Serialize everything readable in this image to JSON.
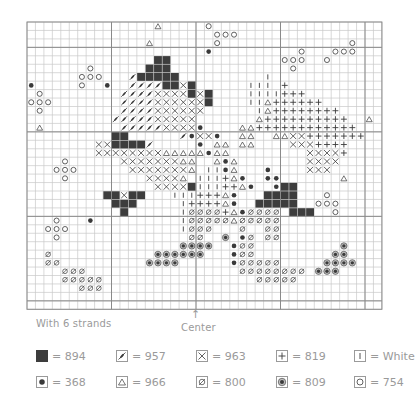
{
  "caption_left": "With 6 strands",
  "caption_center": "Center",
  "center_arrow": "↑",
  "grid": {
    "cols": 42,
    "rows": 34,
    "origin_x": 27,
    "origin_y": 22,
    "cell": 8.45,
    "bold_cols": [
      10,
      20,
      30,
      40
    ],
    "bold_rows": [
      3,
      13,
      23,
      33
    ]
  },
  "colors": {
    "ink": "#3a3a3a",
    "grid_line": "#c8c8c8",
    "bold_line": "#8a8a8a",
    "legend_text": "#9a9a9a"
  },
  "legend": [
    {
      "symbol": "B",
      "icon": "filled-square-icon",
      "label": "= 894"
    },
    {
      "symbol": "S",
      "icon": "slash-leaf-icon",
      "label": "= 957"
    },
    {
      "symbol": "X",
      "icon": "cross-x-icon",
      "label": "= 963"
    },
    {
      "symbol": "P",
      "icon": "plus-icon",
      "label": "= 819"
    },
    {
      "symbol": "I",
      "icon": "vertical-bar-icon",
      "label": "= White"
    },
    {
      "symbol": "D",
      "icon": "filled-dot-icon",
      "label": "= 368"
    },
    {
      "symbol": "T",
      "icon": "triangle-icon",
      "label": "= 966"
    },
    {
      "symbol": "Z",
      "icon": "slashed-circle-icon",
      "label": "= 800"
    },
    {
      "symbol": "R",
      "icon": "ringed-dot-icon",
      "label": "= 809"
    },
    {
      "symbol": "O",
      "icon": "open-circle-icon",
      "label": "= 754"
    }
  ],
  "cells": [
    "...............T.....O....................",
    "......................OOO.................",
    "..............T.......O...............O...",
    ".....................D..........O...OOO...",
    "...............BB.............OOO..O......",
    ".......O......BBB..............O..........",
    "......OOO...SBBBBB..........I.............",
    "D.....O..D..SSSSBBXB......III.P...........",
    ".O.........SSSSXXXXBXB....IIIIPPP.........",
    "OOO........SSSSXXXXXXB....IITPPPPPP.......",
    ".O.........SSSSXXXXXX......ITPPPPPPPP.....",
    "..........SSSSSXXXXX.......TPPPPPPPPPP..T.",
    ".T.........SSSSSXXXXD....TTPPPPPPPPPPPP...",
    "..........BB......SDXXD..TT..TTXXPPPPPPP..",
    "........XXBBBBS.....D.TT.TT....XXXPPPP....",
    "........XXXXXXXXTTTTTDTT.........XXXXP....",
    "....O......XXXXXXXTT..TDT........XXXX.....",
    "...OOO......XXXXXXXT.IIDT...D....XXX......",
    "....O.........XXXXT.IIIPTD..DD.......T....",
    "...............XXXXBIIIPPTD..DBB..........",
    ".........BBXBB...IIIPPPTD...BBBB...O......",
    "..........BBB.....IPPPPTD..BBBBB..OOO.....",
    "...........B......IZZZZPTDZZZZ.BBB..O.....",
    "...O...D..........IZZZZZTZZZZZ............",
    "..OOO.............IZZZ...Z..ZZ............",
    "...O...............ZZ..R.DZ.ZZ............",
    "..................RRRR..DZZ..........R....",
    "..Z............RRRRRR...DZZ.........RR....",
    "..ZZ..........RRRR......DZZZZZ.....RRRR...",
    "....ZZZ..................ZZZZZZZZ.RRR.....",
    "....ZZZZZ..................ZZZZZ..........",
    "......ZZZ.................................",
    "..........................................",
    ".........................................."
  ]
}
